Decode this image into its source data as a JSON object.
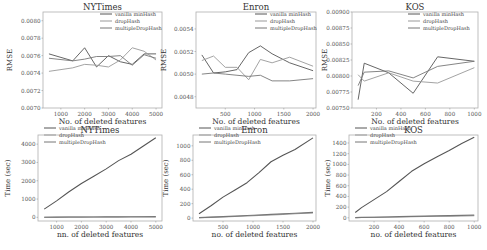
{
  "chart_data": [
    {
      "type": "line",
      "title": "NYTimes",
      "xlabel": "No. of deleted features",
      "ylabel": "RMSE",
      "xlim": [
        250,
        5250
      ],
      "ylim": [
        0.007,
        0.0081
      ],
      "xticks": [
        1000,
        2000,
        3000,
        4000,
        5000
      ],
      "xtick_labels": [
        "1000",
        "2000",
        "3000",
        "4000",
        "5000"
      ],
      "yticks": [
        0.007,
        0.0072,
        0.0074,
        0.0076,
        0.0078,
        0.008
      ],
      "ytick_labels": [
        "0.0070",
        "0.0072",
        "0.0074",
        "0.0076",
        "0.0078",
        "0.0080"
      ],
      "legend": "top-right",
      "grid": false,
      "x": [
        500,
        1500,
        2000,
        2500,
        3000,
        3500,
        4000,
        4500,
        5000
      ],
      "series": [
        {
          "name": "vanilla minHash",
          "values": [
            0.00762,
            0.00754,
            0.00769,
            0.00747,
            0.0076,
            0.00753,
            0.0075,
            0.00762,
            0.00762
          ]
        },
        {
          "name": "dropHash",
          "values": [
            0.00742,
            0.00746,
            0.0075,
            0.00749,
            0.00747,
            0.00755,
            0.00769,
            0.00765,
            0.00755
          ]
        },
        {
          "name": "multipleDropHash",
          "values": [
            0.00757,
            0.00754,
            0.00756,
            0.00759,
            0.00759,
            0.0076,
            0.00749,
            0.00761,
            0.00757
          ]
        }
      ]
    },
    {
      "type": "line",
      "title": "Enron",
      "xlabel": "No. of deleted features",
      "ylabel": "RMSE",
      "xlim": [
        0,
        2050
      ],
      "ylim": [
        0.0047,
        0.00555
      ],
      "xticks": [
        500,
        1000,
        1500,
        2000
      ],
      "xtick_labels": [
        "500",
        "1000",
        "1500",
        "2000"
      ],
      "yticks": [
        0.0048,
        0.005,
        0.0052,
        0.0054
      ],
      "ytick_labels": [
        "0.0048",
        "0.0050",
        "0.0052",
        "0.0054"
      ],
      "legend": "top-right",
      "grid": false,
      "x": [
        100,
        300,
        500,
        700,
        900,
        1100,
        1300,
        1600,
        2000
      ],
      "series": [
        {
          "name": "vanilla minHash",
          "values": [
            0.00517,
            0.00501,
            0.00502,
            0.00504,
            0.00519,
            0.00525,
            0.00518,
            0.0051,
            0.00503
          ]
        },
        {
          "name": "dropHash",
          "values": [
            0.00512,
            0.00516,
            0.00506,
            0.00506,
            0.00495,
            0.00513,
            0.0051,
            0.00515,
            0.00507
          ]
        },
        {
          "name": "multipleDropHash",
          "values": [
            0.005,
            0.00501,
            0.005,
            0.00499,
            0.00498,
            0.00499,
            0.00494,
            0.00494,
            0.00496
          ]
        }
      ]
    },
    {
      "type": "line",
      "title": "KOS",
      "xlabel": "No. of deleted features",
      "ylabel": "RMSE",
      "xlim": [
        0,
        1030
      ],
      "ylim": [
        0.0075,
        0.009
      ],
      "xticks": [
        200,
        400,
        600,
        800,
        1000
      ],
      "xtick_labels": [
        "200",
        "400",
        "600",
        "800",
        "1000"
      ],
      "yticks": [
        0.0075,
        0.00775,
        0.008,
        0.00825,
        0.0085,
        0.00875,
        0.009
      ],
      "ytick_labels": [
        "0.00750",
        "0.00775",
        "0.00800",
        "0.00825",
        "0.00850",
        "0.00875",
        "0.00900"
      ],
      "legend": "top-right",
      "grid": false,
      "x": [
        50,
        100,
        300,
        500,
        700,
        1000
      ],
      "series": [
        {
          "name": "vanilla minHash",
          "values": [
            0.00763,
            0.0082,
            0.00805,
            0.00773,
            0.0083,
            0.00823
          ]
        },
        {
          "name": "dropHash",
          "values": [
            0.00802,
            0.00792,
            0.00805,
            0.00792,
            0.00789,
            0.00813
          ]
        },
        {
          "name": "multipleDropHash",
          "values": [
            0.00785,
            0.00806,
            0.00808,
            0.00797,
            0.00815,
            0.00823
          ]
        }
      ]
    },
    {
      "type": "line",
      "title": "NYTimes",
      "xlabel": "nn. of deleted features",
      "ylabel": "Time (sec)",
      "xlim": [
        250,
        5250
      ],
      "ylim": [
        -200,
        4500
      ],
      "xticks": [
        1000,
        2000,
        3000,
        4000,
        5000
      ],
      "xtick_labels": [
        "1000",
        "2000",
        "3000",
        "4000",
        "5000"
      ],
      "yticks": [
        0,
        1000,
        2000,
        3000,
        4000
      ],
      "ytick_labels": [
        "0",
        "1000",
        "2000",
        "3000",
        "4000"
      ],
      "legend": "top-left",
      "grid": false,
      "x": [
        500,
        1000,
        1500,
        2000,
        2500,
        3000,
        3500,
        4000,
        4500,
        5000
      ],
      "series": [
        {
          "name": "vanilla minHash",
          "values": [
            450,
            900,
            1400,
            1850,
            2250,
            2650,
            3100,
            3450,
            3900,
            4350
          ]
        },
        {
          "name": "dropHash",
          "values": [
            5,
            8,
            10,
            12,
            15,
            18,
            20,
            22,
            25,
            28
          ]
        },
        {
          "name": "multipleDropHash",
          "values": [
            8,
            12,
            15,
            18,
            22,
            25,
            28,
            32,
            35,
            40
          ]
        }
      ]
    },
    {
      "type": "line",
      "title": "Enron",
      "xlabel": "no. of deleted features",
      "ylabel": "Time (sec)",
      "xlim": [
        0,
        2050
      ],
      "ylim": [
        -40,
        1150
      ],
      "xticks": [
        500,
        1000,
        1500,
        2000
      ],
      "xtick_labels": [
        "500",
        "1000",
        "1500",
        "2000"
      ],
      "yticks": [
        0,
        200,
        400,
        600,
        800,
        1000
      ],
      "ytick_labels": [
        "0",
        "200",
        "400",
        "600",
        "800",
        "1000"
      ],
      "legend": "top-left",
      "grid": false,
      "x": [
        100,
        300,
        500,
        700,
        900,
        1100,
        1300,
        1500,
        1700,
        2000
      ],
      "series": [
        {
          "name": "vanilla minHash",
          "values": [
            60,
            170,
            290,
            390,
            490,
            630,
            780,
            870,
            950,
            1110
          ]
        },
        {
          "name": "dropHash",
          "values": [
            5,
            10,
            15,
            22,
            30,
            38,
            45,
            52,
            60,
            70
          ]
        },
        {
          "name": "multipleDropHash",
          "values": [
            7,
            13,
            20,
            28,
            36,
            44,
            52,
            60,
            68,
            80
          ]
        }
      ]
    },
    {
      "type": "line",
      "title": "KOS",
      "xlabel": "no. of deleted features",
      "ylabel": "Time (sec)",
      "xlim": [
        0,
        1030
      ],
      "ylim": [
        -60,
        1550
      ],
      "xticks": [
        200,
        400,
        600,
        800,
        1000
      ],
      "xtick_labels": [
        "200",
        "400",
        "600",
        "800",
        "1000"
      ],
      "yticks": [
        0,
        200,
        400,
        600,
        800,
        1000,
        1200,
        1400
      ],
      "ytick_labels": [
        "0",
        "200",
        "400",
        "600",
        "800",
        "1000",
        "1200",
        "1400"
      ],
      "legend": "top-left",
      "grid": false,
      "x": [
        50,
        100,
        200,
        300,
        400,
        500,
        600,
        700,
        800,
        900,
        1000
      ],
      "series": [
        {
          "name": "vanilla minHash",
          "values": [
            100,
            190,
            340,
            490,
            680,
            870,
            1010,
            1140,
            1260,
            1390,
            1510
          ]
        },
        {
          "name": "dropHash",
          "values": [
            3,
            5,
            8,
            12,
            16,
            20,
            24,
            28,
            32,
            36,
            40
          ]
        },
        {
          "name": "multipleDropHash",
          "values": [
            4,
            7,
            11,
            16,
            21,
            26,
            31,
            36,
            41,
            46,
            52
          ]
        }
      ]
    }
  ],
  "series_colors": [
    "#555555",
    "#999999",
    "#777777"
  ]
}
